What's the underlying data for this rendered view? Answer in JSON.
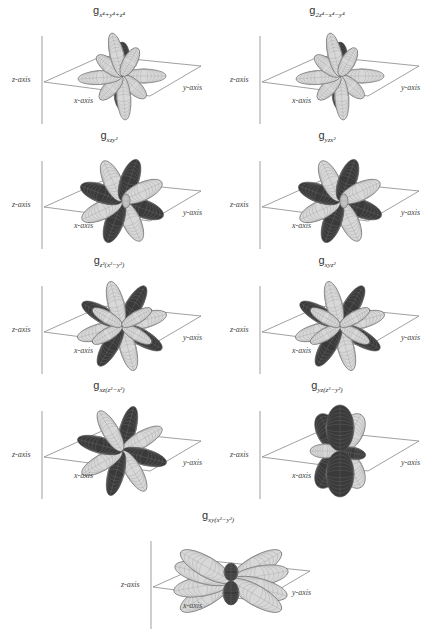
{
  "figure": {
    "panels": [
      {
        "id": "g-x4y4z4",
        "title_main": "g",
        "title_sub": "x⁴+y⁴+z⁴",
        "axes": {
          "z": "z-axis",
          "x": "x-axis",
          "y": "y-axis"
        },
        "style": "axial"
      },
      {
        "id": "g-2z4-x4-y4",
        "title_main": "g",
        "title_sub": "2z⁴−x⁴−y⁴",
        "axes": {
          "z": "z-axis",
          "x": "x-axis",
          "y": "y-axis"
        },
        "style": "axial"
      },
      {
        "id": "g-xzy2",
        "title_main": "g",
        "title_sub": "xzy²",
        "axes": {
          "z": "z-axis",
          "x": "x-axis",
          "y": "y-axis"
        },
        "style": "cubic"
      },
      {
        "id": "g-yzx2",
        "title_main": "g",
        "title_sub": "yzx²",
        "axes": {
          "z": "z-axis",
          "x": "x-axis",
          "y": "y-axis"
        },
        "style": "cubic"
      },
      {
        "id": "g-z2x2-y2",
        "title_main": "g",
        "title_sub": "z²(x²−y²)",
        "axes": {
          "z": "z-axis",
          "x": "x-axis",
          "y": "y-axis"
        },
        "style": "star"
      },
      {
        "id": "g-xyz2",
        "title_main": "g",
        "title_sub": "xyz²",
        "axes": {
          "z": "z-axis",
          "x": "x-axis",
          "y": "y-axis"
        },
        "style": "star"
      },
      {
        "id": "g-xzz2-x2",
        "title_main": "g",
        "title_sub": "xz(z²−x²)",
        "axes": {
          "z": "z-axis",
          "x": "x-axis",
          "y": "y-axis"
        },
        "style": "rosette"
      },
      {
        "id": "g-yzz2-y2",
        "title_main": "g",
        "title_sub": "yz(z²−y²)",
        "axes": {
          "z": "z-axis",
          "x": "x-axis",
          "y": "y-axis"
        },
        "style": "vertical"
      },
      {
        "id": "g-xyx2-y2",
        "title_main": "g",
        "title_sub": "xy(x²−y²)",
        "axes": {
          "z": "z-axis",
          "x": "x-axis",
          "y": "y-axis"
        },
        "style": "planar"
      }
    ],
    "colors": {
      "dark_lobe": "#3a3a3a",
      "light_lobe": "#d8d8d8",
      "mesh": "#555555",
      "axis_line": "#777777"
    }
  }
}
